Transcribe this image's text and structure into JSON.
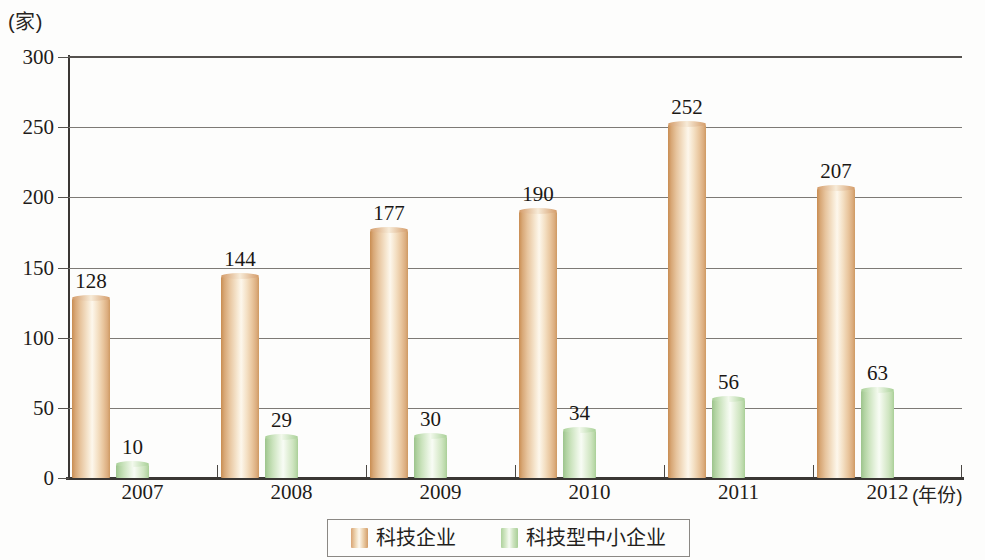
{
  "chart_data": {
    "type": "bar",
    "title": "",
    "subtitle": "",
    "xlabel": "(年份)",
    "ylabel": "(家)",
    "categories": [
      "2007",
      "2008",
      "2009",
      "2010",
      "2011",
      "2012"
    ],
    "series": [
      {
        "name": "科技企业",
        "color": "#e0b183",
        "values": [
          128,
          144,
          177,
          190,
          252,
          207
        ]
      },
      {
        "name": "科技型中小企业",
        "color": "#b5d7a4",
        "values": [
          10,
          29,
          30,
          34,
          56,
          63
        ]
      }
    ],
    "ylim": [
      0,
      300
    ],
    "yticks": [
      "0",
      "50",
      "100",
      "150",
      "200",
      "250",
      "300"
    ],
    "grid": "horizontal",
    "legend_position": "bottom-center",
    "data_labels": true
  },
  "axis": {
    "y_unit": "(家)",
    "x_unit": "(年份)",
    "ticks": [
      "300",
      "250",
      "200",
      "150",
      "100",
      "50",
      "0"
    ]
  },
  "legend": {
    "items": [
      {
        "label": "科技企业",
        "swatch": "cylinder-orange"
      },
      {
        "label": "科技型中小企业",
        "swatch": "cylinder-green"
      }
    ]
  }
}
